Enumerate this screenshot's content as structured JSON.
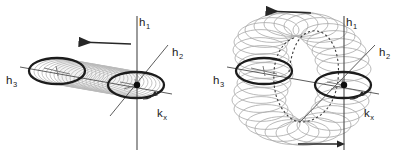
{
  "figure": {
    "background_color": "#ffffff",
    "panels": [
      {
        "id": "left",
        "name": "tube-panel",
        "origin": {
          "x": 135,
          "y": 85
        },
        "axes": [
          {
            "name": "h1",
            "label": "h",
            "subscript": "1",
            "label_x": 139,
            "label_y": 22,
            "orientation": "vertical"
          },
          {
            "name": "h2",
            "label": "h",
            "subscript": "2",
            "label_x": 172,
            "label_y": 52,
            "orientation": "diagonal-up-right"
          },
          {
            "name": "h3",
            "label": "h",
            "subscript": "3",
            "label_x": 6,
            "label_y": 80,
            "orientation": "horizontal-left"
          },
          {
            "name": "kx",
            "label": "k",
            "subscript": "x",
            "label_x": 157,
            "label_y": 113,
            "orientation": "curved-arrow"
          }
        ],
        "arrow": {
          "name": "precession-arrow",
          "direction": "left",
          "x1": 132,
          "y1": 44,
          "x2": 78,
          "y2": 42
        },
        "ellipses": [
          {
            "name": "bold-ellipse-left",
            "cx": 57,
            "cy": 71,
            "rx": 28,
            "ry": 13,
            "bold": true
          },
          {
            "name": "bold-ellipse-right",
            "cx": 136,
            "cy": 85,
            "rx": 28,
            "ry": 13,
            "bold": true
          }
        ],
        "tube": {
          "name": "spiral-tube",
          "count": 22
        }
      },
      {
        "id": "right",
        "name": "torus-panel",
        "origin": {
          "x": 342,
          "y": 85
        },
        "axes": [
          {
            "name": "h1",
            "label": "h",
            "subscript": "1",
            "label_x": 346,
            "label_y": 22,
            "orientation": "vertical"
          },
          {
            "name": "h2",
            "label": "h",
            "subscript": "2",
            "label_x": 379,
            "label_y": 52,
            "orientation": "diagonal-up-right"
          },
          {
            "name": "h3",
            "label": "h",
            "subscript": "3",
            "label_x": 213,
            "label_y": 80,
            "orientation": "horizontal-left"
          },
          {
            "name": "kx",
            "label": "k",
            "subscript": "x",
            "label_x": 364,
            "label_y": 113,
            "orientation": "curved-arrow"
          }
        ],
        "arrows": [
          {
            "name": "top-arrow",
            "direction": "left",
            "x1": 312,
            "y1": 13,
            "x2": 265,
            "y2": 11
          },
          {
            "name": "bottom-arrow",
            "direction": "right",
            "x1": 297,
            "y1": 144,
            "x2": 344,
            "y2": 144
          }
        ],
        "ellipses": [
          {
            "name": "bold-ellipse-left",
            "cx": 264,
            "cy": 71,
            "rx": 28,
            "ry": 13,
            "bold": true
          },
          {
            "name": "bold-ellipse-right",
            "cx": 343,
            "cy": 85,
            "rx": 28,
            "ry": 13,
            "bold": true
          }
        ],
        "torus": {
          "name": "torus-of-ellipses",
          "count": 40,
          "dashed_guide": true
        }
      }
    ]
  }
}
